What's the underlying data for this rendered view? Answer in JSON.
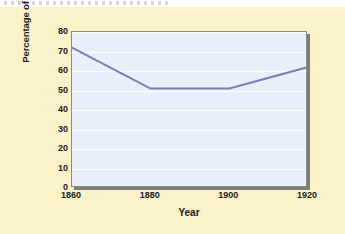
{
  "figure": {
    "background_color": "#fbf2ca",
    "plot_background_color": "#e9f0fa",
    "line_color": "#7b7fb5",
    "frame_color": "#8a8a86",
    "shadow_color": "#7d7d78"
  },
  "chart_data": {
    "type": "line",
    "title": "",
    "xlabel": "Year",
    "ylabel": "Percentage of Average U.S. Per Capita Income",
    "x": [
      1860,
      1880,
      1900,
      1920
    ],
    "values": [
      72,
      51,
      51,
      62
    ],
    "series": [
      {
        "name": "Percentage of Average U.S. Per Capita Income",
        "values": [
          72,
          51,
          51,
          62
        ]
      }
    ],
    "xticks": [
      1860,
      1880,
      1900,
      1920
    ],
    "xtick_labels": [
      "1860",
      "1880",
      "1900",
      "1920"
    ],
    "yticks": [
      0,
      10,
      20,
      30,
      40,
      50,
      60,
      70,
      80
    ],
    "ytick_labels": [
      "0",
      "10",
      "20",
      "30",
      "40",
      "50",
      "60",
      "70",
      "80"
    ],
    "xlim": [
      1860,
      1920
    ],
    "ylim": [
      0,
      80
    ],
    "grid": true,
    "grid_axis": "y",
    "legend": false,
    "legend_position": "none"
  }
}
